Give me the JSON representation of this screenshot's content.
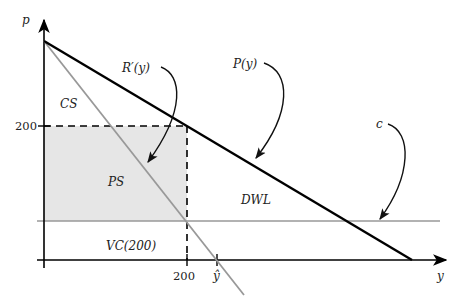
{
  "diagram": {
    "axes": {
      "y_axis_label": "p",
      "x_axis_label": "y",
      "y_ticks": [
        {
          "label": "200"
        }
      ],
      "x_ticks": [
        {
          "label": "200"
        },
        {
          "label": "ŷ"
        }
      ]
    },
    "curves": {
      "demand": {
        "label": "P(y)",
        "color": "#000000"
      },
      "marginal_revenue": {
        "label": "R′(y)",
        "color": "#999999"
      },
      "marginal_cost": {
        "label": "c",
        "color": "#999999"
      }
    },
    "regions": {
      "consumer_surplus": "CS",
      "producer_surplus": "PS",
      "deadweight_loss": "DWL",
      "variable_cost": "VC(200)"
    },
    "colors": {
      "shade": "#e6e6e6",
      "axis": "#000000",
      "dashed": "#000000"
    }
  }
}
